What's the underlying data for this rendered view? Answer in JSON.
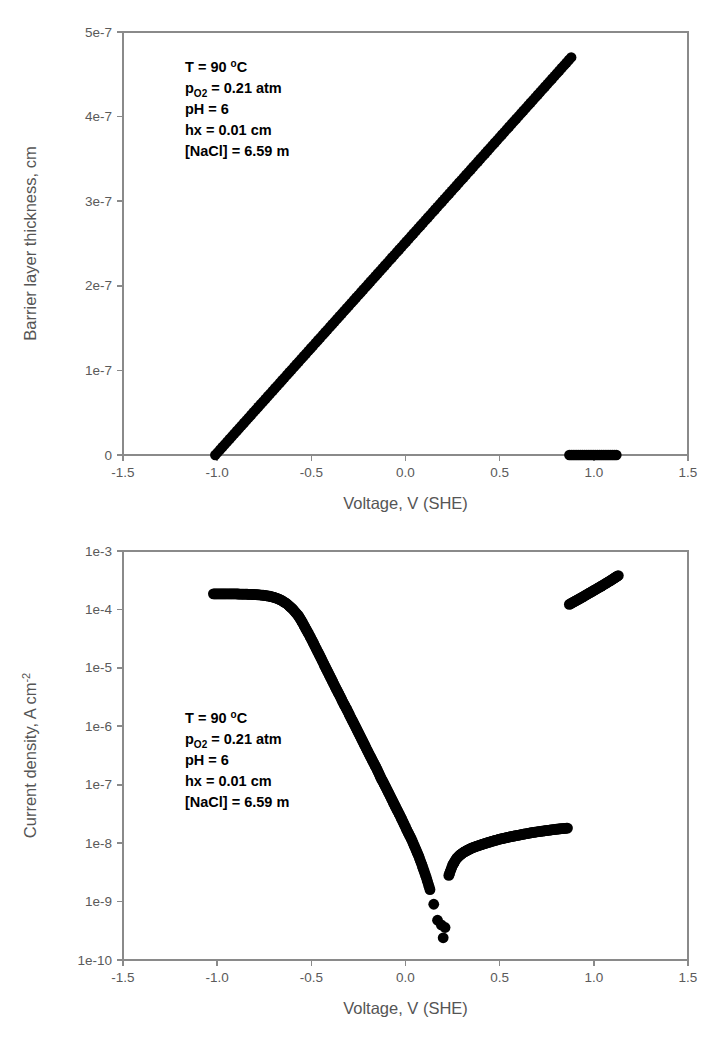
{
  "figure": {
    "title": "",
    "panels": [
      "barrier-layer-thickness",
      "current-density"
    ]
  },
  "annotation": {
    "line1": "T = 90 ",
    "line1_deg": "o",
    "line1_unit": "C",
    "line2_p": "p",
    "line2_sub": "O2",
    "line2_rest": " = 0.21 atm",
    "line3": "pH = 6",
    "line4": "hx = 0.01 cm",
    "line5": "[NaCl] = 6.59 m"
  },
  "chart_data": [
    {
      "id": "barrier-layer-thickness",
      "type": "scatter",
      "title": "",
      "xlabel": "Voltage, V (SHE)",
      "ylabel": "Barrier layer thickness, cm",
      "xlim": [
        -1.5,
        1.5
      ],
      "ylim": [
        0,
        5e-07
      ],
      "xticks": [
        -1.5,
        -1.0,
        -0.5,
        0.0,
        0.5,
        1.0,
        1.5
      ],
      "xticklabels": [
        "-1.5",
        "-1.0",
        "-0.5",
        "0.0",
        "0.5",
        "1.0",
        "1.5"
      ],
      "yticks": [
        0,
        1e-07,
        2e-07,
        3e-07,
        4e-07,
        5e-07
      ],
      "yticklabels": [
        "0",
        "1e-7",
        "2e-7",
        "3e-7",
        "4e-7",
        "5e-7"
      ],
      "grid": false,
      "legend": false,
      "marker": "filled-circle",
      "marker_color": "#000000",
      "series": [
        {
          "name": "passive-film-growth",
          "comment": "linear growth branch from -1.01 V to 0.88 V",
          "x_start": -1.01,
          "x_end": 0.88,
          "y_start": 0.0,
          "y_end": 4.7e-07,
          "n_points": 150
        },
        {
          "name": "transpassive-zero-thickness",
          "comment": "film dissolved, zero thickness branch",
          "x_start": 0.87,
          "x_end": 1.12,
          "y_start": 0.0,
          "y_end": 0.0,
          "n_points": 26
        }
      ]
    },
    {
      "id": "current-density",
      "type": "scatter",
      "title": "",
      "xlabel": "Voltage, V (SHE)",
      "ylabel": "Current density, A cm",
      "ylabel_sup": "-2",
      "xlim": [
        -1.5,
        1.5
      ],
      "ylim": [
        1e-10,
        0.001
      ],
      "yscale": "log",
      "xticks": [
        -1.5,
        -1.0,
        -0.5,
        0.0,
        0.5,
        1.0,
        1.5
      ],
      "xticklabels": [
        "-1.5",
        "-1.0",
        "-0.5",
        "0.0",
        "0.5",
        "1.0",
        "1.5"
      ],
      "yticks": [
        1e-10,
        1e-09,
        1e-08,
        1e-07,
        1e-06,
        1e-05,
        0.0001,
        0.001
      ],
      "yticklabels": [
        "1e-10",
        "1e-9",
        "1e-8",
        "1e-7",
        "1e-6",
        "1e-5",
        "1e-4",
        "1e-3"
      ],
      "grid": false,
      "legend": false,
      "marker": "filled-circle",
      "marker_color": "#000000",
      "points": {
        "cathodic": [
          [
            -1.02,
            0.000185
          ],
          [
            -0.99,
            0.000185
          ],
          [
            -0.96,
            0.000185
          ],
          [
            -0.93,
            0.000184
          ],
          [
            -0.9,
            0.000184
          ],
          [
            -0.87,
            0.000183
          ],
          [
            -0.84,
            0.000182
          ],
          [
            -0.81,
            0.00018
          ],
          [
            -0.78,
            0.000178
          ],
          [
            -0.75,
            0.000174
          ],
          [
            -0.72,
            0.000168
          ],
          [
            -0.69,
            0.000158
          ],
          [
            -0.66,
            0.000144
          ],
          [
            -0.63,
            0.000125
          ],
          [
            -0.6,
            0.000102
          ],
          [
            -0.57,
            7.9e-05
          ],
          [
            -0.55,
            6.2e-05
          ],
          [
            -0.53,
            4.7e-05
          ],
          [
            -0.51,
            3.6e-05
          ],
          [
            -0.49,
            2.7e-05
          ],
          [
            -0.47,
            2e-05
          ],
          [
            -0.45,
            1.5e-05
          ],
          [
            -0.43,
            1.1e-05
          ],
          [
            -0.41,
            8.2e-06
          ],
          [
            -0.39,
            6.1e-06
          ],
          [
            -0.37,
            4.5e-06
          ],
          [
            -0.35,
            3.4e-06
          ],
          [
            -0.33,
            2.5e-06
          ],
          [
            -0.31,
            1.9e-06
          ],
          [
            -0.29,
            1.4e-06
          ],
          [
            -0.27,
            1.05e-06
          ],
          [
            -0.25,
            7.8e-07
          ],
          [
            -0.23,
            5.8e-07
          ],
          [
            -0.21,
            4.3e-07
          ],
          [
            -0.19,
            3.2e-07
          ],
          [
            -0.17,
            2.4e-07
          ],
          [
            -0.15,
            1.8e-07
          ],
          [
            -0.13,
            1.3e-07
          ],
          [
            -0.11,
            9.8e-08
          ],
          [
            -0.09,
            7.3e-08
          ],
          [
            -0.07,
            5.4e-08
          ],
          [
            -0.05,
            4e-08
          ],
          [
            -0.03,
            3e-08
          ],
          [
            -0.01,
            2.2e-08
          ],
          [
            0.01,
            1.6e-08
          ],
          [
            0.03,
            1.2e-08
          ],
          [
            0.05,
            8.5e-09
          ],
          [
            0.07,
            6e-09
          ],
          [
            0.09,
            4e-09
          ],
          [
            0.11,
            2.6e-09
          ],
          [
            0.13,
            1.6e-09
          ],
          [
            0.15,
            9e-10
          ],
          [
            0.17,
            4.8e-10
          ],
          [
            0.19,
            4e-10
          ],
          [
            0.21,
            3.6e-10
          ]
        ],
        "outlier": [
          [
            0.2,
            2.4e-10
          ]
        ],
        "passive": [
          [
            0.23,
            2.8e-09
          ],
          [
            0.25,
            4.2e-09
          ],
          [
            0.27,
            5.4e-09
          ],
          [
            0.29,
            6.3e-09
          ],
          [
            0.31,
            7e-09
          ],
          [
            0.33,
            7.6e-09
          ],
          [
            0.35,
            8.2e-09
          ],
          [
            0.38,
            8.9e-09
          ],
          [
            0.41,
            9.6e-09
          ],
          [
            0.44,
            1.03e-08
          ],
          [
            0.47,
            1.1e-08
          ],
          [
            0.5,
            1.17e-08
          ],
          [
            0.53,
            1.23e-08
          ],
          [
            0.56,
            1.29e-08
          ],
          [
            0.59,
            1.35e-08
          ],
          [
            0.62,
            1.41e-08
          ],
          [
            0.65,
            1.47e-08
          ],
          [
            0.68,
            1.53e-08
          ],
          [
            0.71,
            1.58e-08
          ],
          [
            0.74,
            1.63e-08
          ],
          [
            0.77,
            1.68e-08
          ],
          [
            0.8,
            1.73e-08
          ],
          [
            0.83,
            1.77e-08
          ],
          [
            0.86,
            1.81e-08
          ]
        ],
        "transpassive": [
          [
            0.87,
            0.000122
          ],
          [
            0.9,
            0.000138
          ],
          [
            0.93,
            0.000156
          ],
          [
            0.96,
            0.000178
          ],
          [
            0.99,
            0.000202
          ],
          [
            1.02,
            0.00023
          ],
          [
            1.05,
            0.000262
          ],
          [
            1.08,
            0.0003
          ],
          [
            1.11,
            0.000345
          ],
          [
            1.13,
            0.00038
          ]
        ]
      }
    }
  ]
}
